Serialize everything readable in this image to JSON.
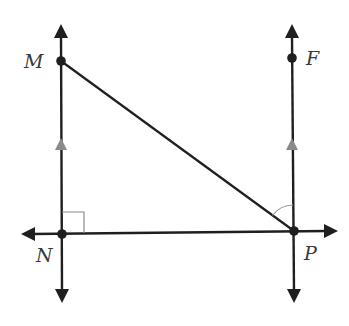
{
  "diagram": {
    "type": "geometry",
    "colors": {
      "line": "#1f1f1f",
      "parallel_mark": "#8a8a8a",
      "angle_mark": "#9a9a9a",
      "label": "#3a3a3a",
      "background": "#ffffff"
    },
    "points": [
      {
        "id": "M",
        "label": "M",
        "x": 61,
        "y": 61,
        "label_x": 24,
        "label_y": 68
      },
      {
        "id": "F",
        "label": "F",
        "x": 292,
        "y": 58,
        "label_x": 306,
        "label_y": 65
      },
      {
        "id": "N",
        "label": "N",
        "x": 62,
        "y": 234,
        "label_x": 36,
        "label_y": 262
      },
      {
        "id": "P",
        "label": "P",
        "x": 294,
        "y": 231,
        "label_x": 304,
        "label_y": 260
      }
    ],
    "lines": [
      {
        "name": "line-MN",
        "description": "vertical line through M and N (both ends arrowed)",
        "parallel_to": "line-FP"
      },
      {
        "name": "line-FP",
        "description": "vertical line through F and P (both ends arrowed)",
        "parallel_to": "line-MN"
      },
      {
        "name": "line-NP",
        "description": "horizontal line through N and P (both ends arrowed)"
      }
    ],
    "segments": [
      {
        "name": "segment-MP",
        "from": "M",
        "to": "P"
      }
    ],
    "marks": {
      "right_angle_at": "N",
      "angle_arc_at": "P",
      "angle_arc_between": [
        "PM",
        "PF"
      ],
      "parallel_arrows_on": [
        "line-MN",
        "line-FP"
      ]
    }
  }
}
